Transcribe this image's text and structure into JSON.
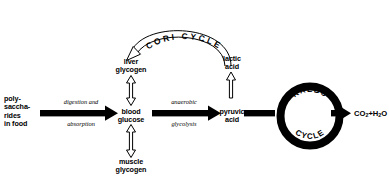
{
  "diagram": {
    "colors": {
      "ink": "#000000",
      "background": "#ffffff"
    },
    "nodes": {
      "source": {
        "label": "poly-\nsaccha-\nrides\nin food"
      },
      "blood_glucose": {
        "label": "blood\nglucose"
      },
      "liver_glycogen": {
        "label": "liver\nglycogen"
      },
      "muscle_glycogen": {
        "label": "muscle\nglycogen"
      },
      "pyruvic_acid": {
        "label": "pyruvic\nacid"
      },
      "lactic_acid": {
        "label": "lactic\nacid"
      },
      "krebs_top": {
        "label": "KREBS"
      },
      "krebs_bottom": {
        "label": "CYCLE"
      },
      "output": {
        "formula_prefix": "CO",
        "sub1": "2",
        "plus": "+H",
        "sub2": "2",
        "suffix": "O"
      }
    },
    "edges": {
      "digestion": {
        "line1": "digestion and",
        "line2": "absorption"
      },
      "glycolysis": {
        "line1": "anaerobic",
        "line2": "glycolysis"
      }
    },
    "cycles": {
      "cori": {
        "label": "CORI  CYCLE"
      }
    }
  }
}
